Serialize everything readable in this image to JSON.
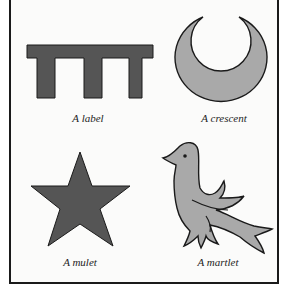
{
  "figure": {
    "colors": {
      "dark_fill": "#555555",
      "light_fill": "#a9a9a9",
      "outline": "#1a1a1a",
      "frame": "#1a1a1a",
      "background": "#fbfbfa"
    },
    "charges": [
      {
        "name": "label",
        "icon": "label-icon",
        "caption": "A label"
      },
      {
        "name": "crescent",
        "icon": "crescent-icon",
        "caption": "A crescent"
      },
      {
        "name": "mullet",
        "icon": "star-icon",
        "caption": "A mulet"
      },
      {
        "name": "martlet",
        "icon": "martlet-bird-icon",
        "caption": "A martlet"
      }
    ]
  }
}
